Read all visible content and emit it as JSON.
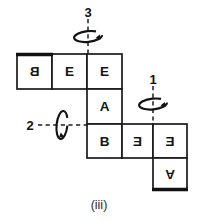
{
  "figure": {
    "caption": "(iii)",
    "kind": "cube-net-with-rotation-axes",
    "ink_color": "#141414",
    "paper_color": "#ffffff"
  },
  "net": {
    "cell_size": 35,
    "cells": [
      {
        "id": "cell-top-left",
        "label": "B",
        "orientation": "mirrored-horizontal",
        "col": 0,
        "row": 0,
        "x": 17,
        "y": 54,
        "w": 35,
        "h": 35
      },
      {
        "id": "cell-top-mid",
        "label": "E",
        "orientation": "upright",
        "col": 1,
        "row": 0,
        "x": 52,
        "y": 54,
        "w": 35,
        "h": 35
      },
      {
        "id": "cell-top-right",
        "label": "E",
        "orientation": "upright",
        "col": 2,
        "row": 0,
        "x": 87,
        "y": 54,
        "w": 35,
        "h": 35
      },
      {
        "id": "cell-middle",
        "label": "A",
        "orientation": "upright",
        "col": 2,
        "row": 1,
        "x": 87,
        "y": 89,
        "w": 35,
        "h": 35
      },
      {
        "id": "cell-bottom-left",
        "label": "B",
        "orientation": "upright",
        "col": 2,
        "row": 2,
        "x": 87,
        "y": 124,
        "w": 35,
        "h": 34
      },
      {
        "id": "cell-bottom-mid",
        "label": "E",
        "orientation": "mirrored-horizontal",
        "col": 3,
        "row": 2,
        "x": 122,
        "y": 124,
        "w": 31,
        "h": 34
      },
      {
        "id": "cell-bottom-right",
        "label": "E",
        "orientation": "mirrored-horizontal",
        "col": 4,
        "row": 2,
        "x": 153,
        "y": 124,
        "w": 34,
        "h": 34
      },
      {
        "id": "cell-last",
        "label": "A",
        "orientation": "rotated-180",
        "col": 4,
        "row": 3,
        "x": 153,
        "y": 158,
        "w": 34,
        "h": 32
      }
    ],
    "bold_edges": [
      {
        "id": "bold-top-left-edge",
        "x1": 16,
        "y1": 54,
        "x2": 53,
        "y2": 54
      },
      {
        "id": "bold-bottom-last-edge",
        "x1": 152,
        "y1": 190,
        "x2": 188,
        "y2": 190
      }
    ]
  },
  "axes": [
    {
      "id": "axis-3",
      "label": "3",
      "kind": "vertical-dashed",
      "label_x": 88,
      "label_y": 12,
      "line_x1": 88,
      "line_y1": 20,
      "line_x2": 88,
      "line_y2": 56,
      "rotation_direction": "clockwise-viewed-from-top"
    },
    {
      "id": "axis-1",
      "label": "1",
      "kind": "vertical-dashed",
      "label_x": 153,
      "label_y": 79,
      "line_x1": 153,
      "line_y1": 86,
      "line_x2": 153,
      "line_y2": 126,
      "rotation_direction": "clockwise-viewed-from-top"
    },
    {
      "id": "axis-2",
      "label": "2",
      "kind": "horizontal-dashed",
      "label_x": 31,
      "label_y": 125,
      "line_x1": 38,
      "line_y1": 125,
      "line_x2": 90,
      "line_y2": 125,
      "rotation_direction": "clockwise-viewed-from-left"
    }
  ]
}
